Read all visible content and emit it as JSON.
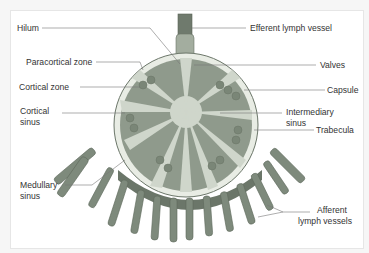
{
  "figure": {
    "labels_left": [
      {
        "id": "hilum",
        "text": "Hilum"
      },
      {
        "id": "paracortical",
        "text": "Paracortical zone"
      },
      {
        "id": "cortical-zone",
        "text": "Cortical zone"
      },
      {
        "id": "cortical-sinus",
        "line1": "Cortical",
        "line2": "sinus"
      },
      {
        "id": "medullary-sinus",
        "line1": "Medullary",
        "line2": "sinus"
      }
    ],
    "labels_right": [
      {
        "id": "efferent",
        "text": "Efferent lymph vessel"
      },
      {
        "id": "valves",
        "text": "Valves"
      },
      {
        "id": "capsule",
        "text": "Capsule"
      },
      {
        "id": "intermediary-sinus",
        "line1": "Intermediary",
        "line2": "sinus"
      },
      {
        "id": "trabecula",
        "text": "Trabecula"
      },
      {
        "id": "afferent",
        "line1": "Afferent",
        "line2": "lymph vessels"
      }
    ],
    "colors": {
      "card_bg": "#ffffff",
      "page_bg": "#f6f6f6",
      "capsule_fill": "#e8ece4",
      "cortex_fill": "#8f9a8c",
      "medulla_fill": "#cfd6cb",
      "vessel_fill": "#7e8a7c",
      "vessel_dark": "#6b7669",
      "leader_line": "#777777"
    }
  }
}
